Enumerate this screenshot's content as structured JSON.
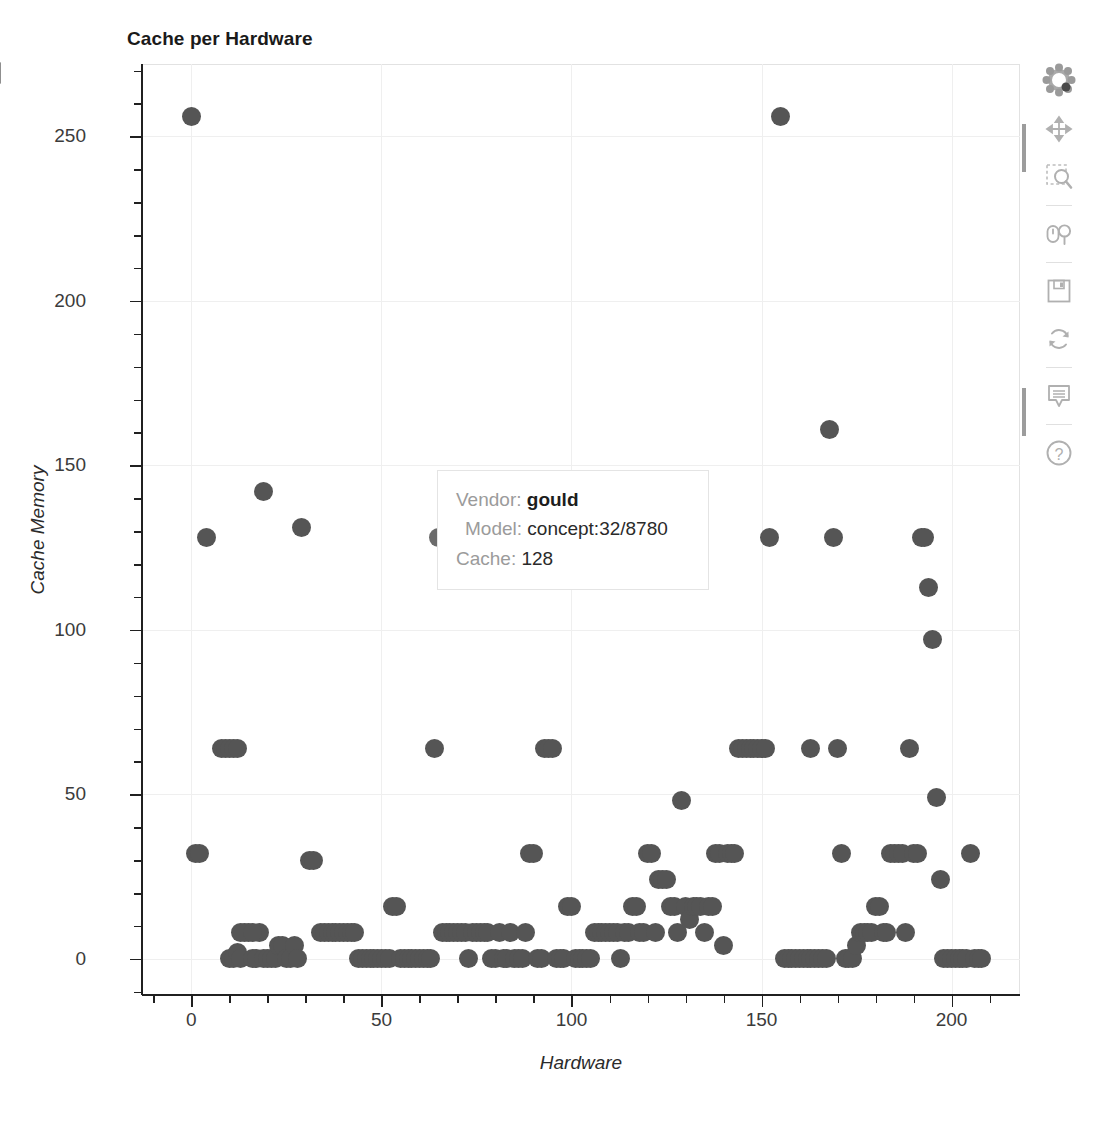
{
  "title": "Cache per Hardware",
  "axes": {
    "x": {
      "label": "Hardware",
      "ticks": [
        0,
        50,
        100,
        150,
        200
      ],
      "range": [
        -13,
        218
      ]
    },
    "y": {
      "label": "Cache Memory",
      "ticks": [
        0,
        50,
        100,
        150,
        200,
        250
      ],
      "range": [
        -11,
        272
      ]
    }
  },
  "tooltip": {
    "visible": true,
    "rows": [
      {
        "label": "Vendor:",
        "value": "gould"
      },
      {
        "label": "Model:",
        "value": "concept:32/8780"
      },
      {
        "label": "Cache:",
        "value": "128"
      }
    ],
    "vendor_label": "Vendor:",
    "vendor_value": "gould",
    "model_label": "Model:",
    "model_value": "concept:32/8780",
    "cache_label": "Cache:",
    "cache_value": "128"
  },
  "toolbar": {
    "logo_name": "bokeh-logo",
    "tools": [
      {
        "name": "pan-tool",
        "title": "Pan",
        "active": true
      },
      {
        "name": "box-zoom-tool",
        "title": "Box Zoom",
        "active": false
      },
      {
        "name": "wheel-zoom-tool",
        "title": "Wheel Zoom",
        "active": false
      },
      {
        "name": "save-tool",
        "title": "Save",
        "active": false
      },
      {
        "name": "reset-tool",
        "title": "Reset",
        "active": false
      },
      {
        "name": "hover-tool",
        "title": "Hover",
        "active": true
      },
      {
        "name": "help-tool",
        "title": "Help",
        "active": false
      }
    ]
  },
  "colors": {
    "marker": "#555555",
    "marker_hover": "#6b6b6b",
    "grid": "#efefef",
    "axis": "#202020",
    "tooltip_label": "#9b9b9b",
    "tooltip_value": "#1d1d1d",
    "toolbar_icon": "#b7b7b7"
  },
  "chart_data": {
    "type": "scatter",
    "title": "Cache per Hardware",
    "xlabel": "Hardware",
    "ylabel": "Cache Memory",
    "xlim": [
      -13,
      218
    ],
    "ylim": [
      -11,
      272
    ],
    "grid": true,
    "legend": "none",
    "marker_size": 19,
    "marker_color": "#555555",
    "highlighted_point": {
      "x": 65,
      "y": 128,
      "vendor": "gould",
      "model": "concept:32/8780",
      "cache": 128
    },
    "points": [
      [
        0,
        256
      ],
      [
        4,
        128
      ],
      [
        8,
        64
      ],
      [
        9,
        64
      ],
      [
        10,
        64
      ],
      [
        11,
        64
      ],
      [
        12,
        64
      ],
      [
        19,
        142
      ],
      [
        29,
        131
      ],
      [
        1,
        32
      ],
      [
        2,
        32
      ],
      [
        31,
        30
      ],
      [
        32,
        30
      ],
      [
        10,
        0
      ],
      [
        11,
        0
      ],
      [
        12,
        2
      ],
      [
        13,
        0
      ],
      [
        14,
        8
      ],
      [
        15,
        8
      ],
      [
        16,
        0
      ],
      [
        17,
        0
      ],
      [
        18,
        8
      ],
      [
        19,
        0
      ],
      [
        20,
        0
      ],
      [
        21,
        0
      ],
      [
        22,
        0
      ],
      [
        23,
        4
      ],
      [
        24,
        4
      ],
      [
        25,
        0
      ],
      [
        26,
        0
      ],
      [
        27,
        4
      ],
      [
        28,
        0
      ],
      [
        13,
        8
      ],
      [
        16,
        8
      ],
      [
        34,
        8
      ],
      [
        35,
        8
      ],
      [
        36,
        8
      ],
      [
        37,
        8
      ],
      [
        38,
        8
      ],
      [
        39,
        8
      ],
      [
        40,
        8
      ],
      [
        41,
        8
      ],
      [
        42,
        8
      ],
      [
        43,
        8
      ],
      [
        44,
        0
      ],
      [
        45,
        0
      ],
      [
        46,
        0
      ],
      [
        47,
        0
      ],
      [
        48,
        0
      ],
      [
        49,
        0
      ],
      [
        50,
        0
      ],
      [
        51,
        0
      ],
      [
        52,
        0
      ],
      [
        53,
        16
      ],
      [
        54,
        16
      ],
      [
        55,
        0
      ],
      [
        56,
        0
      ],
      [
        57,
        0
      ],
      [
        58,
        0
      ],
      [
        59,
        0
      ],
      [
        60,
        0
      ],
      [
        61,
        0
      ],
      [
        62,
        0
      ],
      [
        63,
        0
      ],
      [
        64,
        64
      ],
      [
        65,
        128
      ],
      [
        66,
        8
      ],
      [
        67,
        8
      ],
      [
        68,
        8
      ],
      [
        69,
        8
      ],
      [
        70,
        8
      ],
      [
        71,
        8
      ],
      [
        72,
        8
      ],
      [
        73,
        0
      ],
      [
        74,
        8
      ],
      [
        75,
        8
      ],
      [
        76,
        8
      ],
      [
        77,
        8
      ],
      [
        78,
        8
      ],
      [
        79,
        0
      ],
      [
        80,
        0
      ],
      [
        81,
        8
      ],
      [
        82,
        0
      ],
      [
        83,
        0
      ],
      [
        84,
        8
      ],
      [
        85,
        0
      ],
      [
        86,
        0
      ],
      [
        87,
        0
      ],
      [
        88,
        8
      ],
      [
        89,
        32
      ],
      [
        90,
        32
      ],
      [
        91,
        0
      ],
      [
        92,
        0
      ],
      [
        93,
        64
      ],
      [
        94,
        64
      ],
      [
        95,
        64
      ],
      [
        96,
        0
      ],
      [
        97,
        0
      ],
      [
        98,
        0
      ],
      [
        99,
        16
      ],
      [
        100,
        16
      ],
      [
        101,
        0
      ],
      [
        102,
        0
      ],
      [
        103,
        0
      ],
      [
        104,
        0
      ],
      [
        105,
        0
      ],
      [
        106,
        8
      ],
      [
        107,
        8
      ],
      [
        108,
        8
      ],
      [
        109,
        8
      ],
      [
        110,
        8
      ],
      [
        111,
        8
      ],
      [
        112,
        8
      ],
      [
        113,
        0
      ],
      [
        114,
        8
      ],
      [
        115,
        8
      ],
      [
        116,
        16
      ],
      [
        117,
        16
      ],
      [
        118,
        8
      ],
      [
        119,
        8
      ],
      [
        120,
        32
      ],
      [
        121,
        32
      ],
      [
        122,
        8
      ],
      [
        123,
        24
      ],
      [
        124,
        24
      ],
      [
        125,
        24
      ],
      [
        126,
        16
      ],
      [
        127,
        16
      ],
      [
        128,
        8
      ],
      [
        129,
        48
      ],
      [
        130,
        16
      ],
      [
        131,
        12
      ],
      [
        132,
        16
      ],
      [
        133,
        16
      ],
      [
        134,
        16
      ],
      [
        135,
        8
      ],
      [
        136,
        16
      ],
      [
        137,
        16
      ],
      [
        138,
        32
      ],
      [
        139,
        32
      ],
      [
        140,
        4
      ],
      [
        141,
        32
      ],
      [
        142,
        32
      ],
      [
        143,
        32
      ],
      [
        144,
        64
      ],
      [
        145,
        64
      ],
      [
        146,
        64
      ],
      [
        147,
        64
      ],
      [
        148,
        64
      ],
      [
        149,
        64
      ],
      [
        150,
        64
      ],
      [
        151,
        64
      ],
      [
        152,
        128
      ],
      [
        155,
        256
      ],
      [
        156,
        0
      ],
      [
        157,
        0
      ],
      [
        158,
        0
      ],
      [
        159,
        0
      ],
      [
        160,
        0
      ],
      [
        161,
        0
      ],
      [
        162,
        0
      ],
      [
        163,
        0
      ],
      [
        164,
        0
      ],
      [
        165,
        0
      ],
      [
        166,
        0
      ],
      [
        167,
        0
      ],
      [
        163,
        64
      ],
      [
        168,
        161
      ],
      [
        169,
        128
      ],
      [
        170,
        64
      ],
      [
        171,
        32
      ],
      [
        172,
        0
      ],
      [
        173,
        0
      ],
      [
        174,
        0
      ],
      [
        175,
        4
      ],
      [
        176,
        8
      ],
      [
        177,
        8
      ],
      [
        178,
        8
      ],
      [
        179,
        8
      ],
      [
        180,
        16
      ],
      [
        181,
        16
      ],
      [
        182,
        8
      ],
      [
        183,
        8
      ],
      [
        184,
        32
      ],
      [
        185,
        32
      ],
      [
        186,
        32
      ],
      [
        187,
        32
      ],
      [
        188,
        8
      ],
      [
        189,
        64
      ],
      [
        190,
        32
      ],
      [
        191,
        32
      ],
      [
        192,
        128
      ],
      [
        193,
        128
      ],
      [
        194,
        113
      ],
      [
        195,
        97
      ],
      [
        196,
        49
      ],
      [
        197,
        24
      ],
      [
        198,
        0
      ],
      [
        199,
        0
      ],
      [
        200,
        0
      ],
      [
        201,
        0
      ],
      [
        202,
        0
      ],
      [
        203,
        0
      ],
      [
        204,
        0
      ],
      [
        205,
        32
      ],
      [
        206,
        0
      ],
      [
        207,
        0
      ],
      [
        208,
        0
      ]
    ]
  }
}
